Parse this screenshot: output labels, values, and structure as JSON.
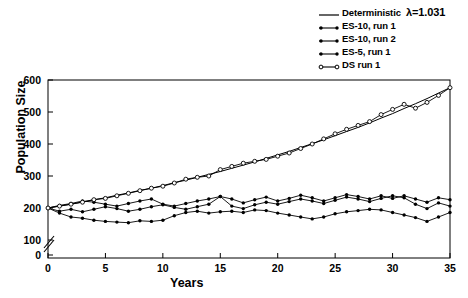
{
  "chart_data": {
    "type": "line",
    "title": "",
    "xlabel": "Years",
    "ylabel": "Population Size",
    "xlim": [
      0,
      35
    ],
    "ylim": [
      100,
      600
    ],
    "y_axis_break": true,
    "y_break_low": 0,
    "grid": false,
    "legend_position": "top-right",
    "xticks": [
      0,
      5,
      10,
      15,
      20,
      25,
      30,
      35
    ],
    "xticklabels": [
      "0",
      "5",
      "10",
      "15",
      "20",
      "25",
      "30",
      "35"
    ],
    "yticks": [
      0,
      100,
      200,
      300,
      400,
      500,
      600
    ],
    "yticklabels": [
      "0",
      "100",
      "200",
      "300",
      "400",
      "500",
      "600"
    ],
    "annotations": [
      {
        "text": "λ=1.031",
        "target": "Deterministic"
      }
    ],
    "x": [
      0,
      1,
      2,
      3,
      4,
      5,
      6,
      7,
      8,
      9,
      10,
      11,
      12,
      13,
      14,
      15,
      16,
      17,
      18,
      19,
      20,
      21,
      22,
      23,
      24,
      25,
      26,
      27,
      28,
      29,
      30,
      31,
      32,
      33,
      34,
      35
    ],
    "series": [
      {
        "name": "Deterministic",
        "marker": "none",
        "line": "solid",
        "fill": "none",
        "values": [
          200,
          206,
          212,
          219,
          226,
          232,
          240,
          247,
          255,
          262,
          270,
          279,
          287,
          296,
          305,
          314,
          324,
          334,
          344,
          355,
          366,
          377,
          389,
          401,
          413,
          426,
          439,
          452,
          466,
          481,
          495,
          511,
          526,
          542,
          559,
          576
        ]
      },
      {
        "name": "ES-10, run 1",
        "marker": "filled-circle",
        "line": "solid",
        "fill": "solid",
        "values": [
          200,
          208,
          214,
          222,
          218,
          212,
          206,
          214,
          222,
          228,
          212,
          206,
          214,
          222,
          228,
          236,
          228,
          216,
          226,
          234,
          222,
          230,
          240,
          232,
          222,
          232,
          242,
          236,
          228,
          238,
          230,
          238,
          228,
          218,
          232,
          226
        ]
      },
      {
        "name": "ES-10, run 2",
        "marker": "filled-circle",
        "line": "solid",
        "fill": "solid",
        "values": [
          200,
          190,
          196,
          188,
          196,
          204,
          198,
          190,
          196,
          204,
          210,
          202,
          196,
          204,
          212,
          236,
          206,
          198,
          210,
          218,
          212,
          220,
          228,
          222,
          214,
          224,
          234,
          228,
          220,
          230,
          238,
          232,
          212,
          198,
          216,
          206
        ]
      },
      {
        "name": "ES-5, run 1",
        "marker": "filled-circle",
        "line": "solid",
        "fill": "solid",
        "values": [
          200,
          184,
          172,
          168,
          162,
          158,
          156,
          154,
          160,
          158,
          162,
          176,
          186,
          190,
          184,
          188,
          190,
          186,
          194,
          192,
          184,
          178,
          172,
          166,
          172,
          182,
          188,
          192,
          196,
          194,
          186,
          178,
          170,
          158,
          172,
          186
        ]
      },
      {
        "name": "DS run 1",
        "marker": "open-circle",
        "line": "solid",
        "fill": "none",
        "values": [
          200,
          206,
          212,
          218,
          226,
          230,
          238,
          246,
          254,
          262,
          268,
          278,
          290,
          296,
          300,
          320,
          330,
          340,
          346,
          352,
          362,
          372,
          386,
          400,
          416,
          432,
          446,
          458,
          470,
          492,
          508,
          524,
          512,
          530,
          552,
          576
        ]
      }
    ]
  },
  "legend": {
    "items": [
      {
        "label": "Deterministic",
        "extra": "λ=1.031",
        "symbol": "plain-line"
      },
      {
        "label": "ES-10, run 1",
        "extra": "",
        "symbol": "line-dot"
      },
      {
        "label": "ES-10, run 2",
        "extra": "",
        "symbol": "line-dot"
      },
      {
        "label": "ES-5, run 1",
        "extra": "",
        "symbol": "line-dot"
      },
      {
        "label": "DS run 1",
        "extra": "",
        "symbol": "line-open-dot"
      }
    ]
  },
  "axes": {
    "y_title": "Population Size",
    "x_title": "Years"
  }
}
